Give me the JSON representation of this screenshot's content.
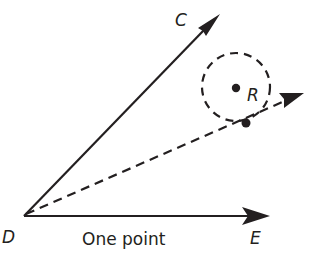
{
  "diagram": {
    "caption": "One point",
    "labels": {
      "vertex": "D",
      "ray_up": "C",
      "ray_right": "E",
      "center": "R"
    },
    "colors": {
      "ink": "#231f20",
      "background": "#ffffff"
    },
    "elements": [
      {
        "type": "ray",
        "from": "D",
        "to": "C",
        "style": "solid"
      },
      {
        "type": "ray",
        "from": "D",
        "to": "E",
        "style": "solid"
      },
      {
        "type": "ray",
        "from": "D",
        "through": "point-on-circle",
        "style": "dashed"
      },
      {
        "type": "circle",
        "center": "R",
        "style": "dashed"
      },
      {
        "type": "point",
        "name": "R"
      },
      {
        "type": "point",
        "name": "point-on-circle"
      }
    ]
  }
}
